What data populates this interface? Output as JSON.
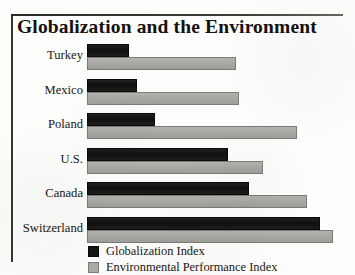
{
  "chart_data": {
    "type": "bar",
    "orientation": "horizontal",
    "title": "Globalization and the Environment",
    "xlabel": "",
    "ylabel": "",
    "grid": false,
    "legend_position": "bottom",
    "categories": [
      "Turkey",
      "Mexico",
      "Poland",
      "U.S.",
      "Canada",
      "Switzerland"
    ],
    "xlim": [
      0,
      100
    ],
    "series": [
      {
        "name": "Globalization Index",
        "color": "#161514",
        "values": [
          16,
          19,
          26,
          54,
          62,
          89
        ]
      },
      {
        "name": "Environmental Performance Index",
        "color": "#a9a9a6",
        "values": [
          57,
          58,
          80,
          67,
          84,
          94
        ]
      }
    ]
  },
  "figure": {
    "title": "Globalization and the Environment"
  },
  "legend": {
    "entries": [
      {
        "label": "Globalization Index",
        "swatch": "dark-square-swatch"
      },
      {
        "label": "Environmental Performance Index",
        "swatch": "gray-square-swatch"
      }
    ]
  }
}
